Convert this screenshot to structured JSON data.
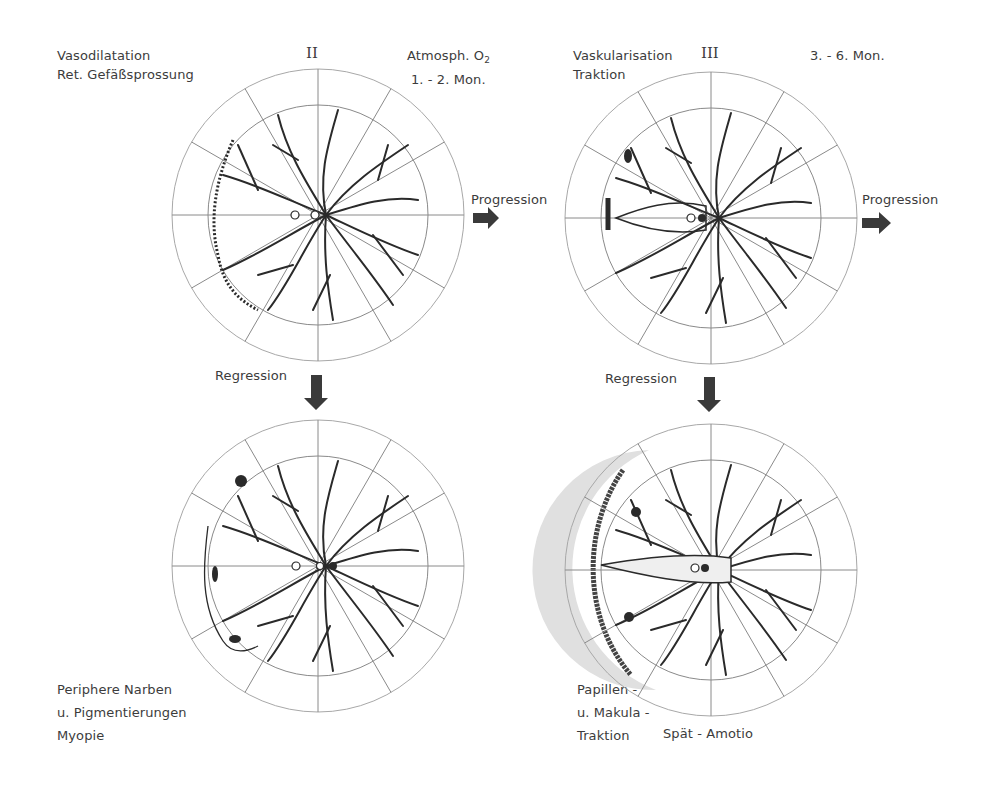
{
  "figure": {
    "stage_ii": {
      "roman": "II",
      "left_lines": [
        "Vasodilatation",
        "Ret. Gefäßsprossung"
      ],
      "right_lines": [
        "Atmosph. O",
        "1. - 2. Mon."
      ],
      "subscript": "2"
    },
    "stage_iii": {
      "roman": "III",
      "left_lines": [
        "Vaskularisation",
        "Traktion"
      ],
      "right_lines": [
        "3. - 6. Mon."
      ]
    },
    "arrows": {
      "progression_1": "Progression",
      "progression_2": "Progression",
      "regression_1": "Regression",
      "regression_2": "Regression"
    },
    "outcome_left": {
      "lines": [
        "Periphere Narben",
        "u. Pigmentierungen",
        "Myopie"
      ]
    },
    "outcome_right": {
      "left_lines": [
        "Papillen -",
        "u. Makula -",
        "Traktion"
      ],
      "right_line": "Spät - Amotio"
    },
    "diagrams": [
      {
        "name": "stage-ii-fundus",
        "cx": 318,
        "cy": 215,
        "r_outer": 146,
        "r_inner": 110
      },
      {
        "name": "stage-iii-fundus",
        "cx": 711,
        "cy": 218,
        "r_outer": 146,
        "r_inner": 110
      },
      {
        "name": "regression-scar-fundus",
        "cx": 318,
        "cy": 566,
        "r_outer": 146,
        "r_inner": 110
      },
      {
        "name": "late-detachment-fundus",
        "cx": 711,
        "cy": 570,
        "r_outer": 146,
        "r_inner": 110
      }
    ],
    "colors": {
      "ink": "#2a2a2a",
      "grid": "#9a9a9a",
      "arrow": "#3a3a3a",
      "shade": "#e6e6e6"
    }
  }
}
